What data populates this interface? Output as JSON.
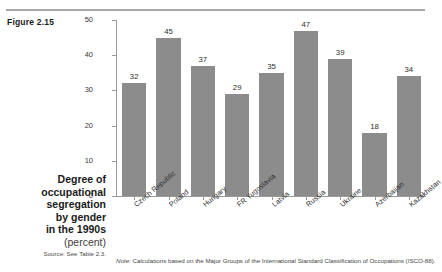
{
  "figure": {
    "number": "Figure 2.15",
    "title_lines": [
      "Degree of",
      "occupational",
      "segregation",
      "by gender",
      "in the 1990s"
    ],
    "unit": "(percent)",
    "source": "Source: See Table 2.3.",
    "note_prefix": "Note:",
    "note": "Calculations based on the Major Groups of the International Standard Classification of Occupations (ISCO-88)."
  },
  "style": {
    "bar_color": "#8c8c8c",
    "axis_color": "#9a9a9a",
    "background": "#ffffff"
  },
  "chart_data": {
    "type": "bar",
    "title": "Degree of occupational segregation by gender in the 1990s (percent)",
    "xlabel": "",
    "ylabel": "",
    "ylim": [
      0,
      50
    ],
    "yticks": [
      0,
      10,
      20,
      30,
      40,
      50
    ],
    "grid": false,
    "legend": "none",
    "categories": [
      "Czech Republic",
      "Poland",
      "Hungary",
      "FR Yugoslavia",
      "Latvia",
      "Russia",
      "Ukraine",
      "Azerbaijan",
      "Kazakhstan"
    ],
    "values": [
      32,
      45,
      37,
      29,
      35,
      47,
      39,
      18,
      34
    ],
    "data_labels": [
      "32",
      "45",
      "37",
      "29",
      "35",
      "47",
      "39",
      "18",
      "34"
    ]
  }
}
